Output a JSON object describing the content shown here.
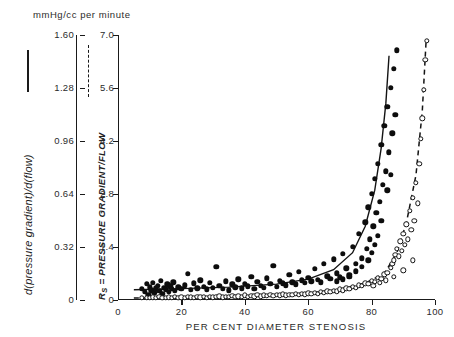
{
  "figure": {
    "units_header": "mmHg/cc per minute",
    "left_axis_caption": "d(pressure gradient)/d(flow)",
    "right_axis_caption_prefix": "R",
    "right_axis_caption_sub": "S",
    "right_axis_caption_rest": " = PRESSURE GRADIENT/FLOW",
    "x_axis_caption": "PER CENT DIAMETER STENOSIS",
    "legend_solid_name": "solid-line-legend-stroke",
    "legend_dashed_name": "dashed-line-legend-stroke"
  },
  "chart_data": {
    "type": "scatter",
    "title": "",
    "xlabel": "PER CENT DIAMETER STENOSIS",
    "ylabel_left": "d(pressure gradient)/d(flow)",
    "ylabel_right": "Rs = PRESSURE GRADIENT/FLOW",
    "units": "mmHg/cc per minute",
    "xlim": [
      0,
      100
    ],
    "xticks": [
      0,
      20,
      40,
      60,
      80,
      100
    ],
    "xticklabels": [
      "0",
      "20",
      "40",
      "60",
      "80",
      "100"
    ],
    "ylim_left": [
      0,
      1.6
    ],
    "yticks_left": [
      0,
      0.32,
      0.64,
      0.96,
      1.28,
      1.6
    ],
    "yticklabels_left": [
      "0",
      "0.32",
      "0.64",
      "0.96",
      "1.28",
      "1.60"
    ],
    "ylim_right": [
      0,
      7.0
    ],
    "yticks_right": [
      0,
      1.4,
      2.8,
      4.2,
      5.6,
      7.0
    ],
    "yticklabels_right": [
      "0",
      "1.4",
      "2.8",
      "4.2",
      "5.6",
      "7.0"
    ],
    "grid": false,
    "legend_position": "axis-captions",
    "series": [
      {
        "name": "d(pressure gradient)/d(flow)",
        "marker": "filled-circle",
        "line": "solid",
        "axis": "left",
        "points": [
          [
            7.5,
            0.3
          ],
          [
            8.5,
            0.22
          ],
          [
            9.0,
            0.42
          ],
          [
            9.5,
            0.13
          ],
          [
            10.0,
            0.34
          ],
          [
            10.5,
            0.26
          ],
          [
            11.0,
            0.45
          ],
          [
            11.5,
            0.19
          ],
          [
            12.0,
            0.31
          ],
          [
            12.5,
            0.38
          ],
          [
            13.0,
            0.24
          ],
          [
            13.5,
            0.5
          ],
          [
            14.0,
            0.17
          ],
          [
            14.5,
            0.33
          ],
          [
            15.0,
            0.28
          ],
          [
            15.5,
            0.41
          ],
          [
            16.0,
            0.22
          ],
          [
            16.5,
            0.36
          ],
          [
            17.0,
            0.3
          ],
          [
            17.5,
            0.47
          ],
          [
            18.0,
            0.25
          ],
          [
            19.0,
            0.34
          ],
          [
            20.0,
            0.29
          ],
          [
            21.0,
            0.39
          ],
          [
            22.0,
            0.7
          ],
          [
            23.0,
            0.27
          ],
          [
            24.0,
            0.44
          ],
          [
            25.0,
            0.31
          ],
          [
            26.0,
            0.52
          ],
          [
            27.0,
            0.35
          ],
          [
            28.0,
            0.28
          ],
          [
            29.0,
            0.46
          ],
          [
            30.0,
            0.33
          ],
          [
            31.0,
            0.88
          ],
          [
            32.0,
            0.37
          ],
          [
            33.0,
            0.3
          ],
          [
            34.0,
            0.49
          ],
          [
            35.0,
            0.26
          ],
          [
            36.0,
            0.41
          ],
          [
            37.0,
            0.34
          ],
          [
            38.0,
            0.55
          ],
          [
            39.0,
            0.31
          ],
          [
            40.0,
            0.43
          ],
          [
            41.0,
            0.36
          ],
          [
            42.0,
            0.62
          ],
          [
            43.0,
            0.29
          ],
          [
            44.0,
            0.48
          ],
          [
            45.0,
            0.38
          ],
          [
            46.0,
            0.33
          ],
          [
            47.0,
            0.57
          ],
          [
            48.0,
            0.42
          ],
          [
            49.0,
            0.9
          ],
          [
            50.0,
            0.35
          ],
          [
            51.0,
            0.51
          ],
          [
            52.0,
            0.44
          ],
          [
            53.0,
            0.39
          ],
          [
            54.0,
            0.66
          ],
          [
            55.0,
            0.47
          ],
          [
            56.0,
            0.41
          ],
          [
            57.0,
            0.74
          ],
          [
            58.0,
            0.52
          ],
          [
            59.0,
            0.45
          ],
          [
            60.0,
            0.58
          ],
          [
            61.0,
            0.49
          ],
          [
            62.0,
            0.82
          ],
          [
            63.0,
            0.54
          ],
          [
            64.0,
            0.47
          ],
          [
            65.0,
            0.95
          ],
          [
            66.0,
            0.63
          ],
          [
            67.0,
            0.56
          ],
          [
            68.0,
            1.08
          ],
          [
            69.0,
            0.71
          ],
          [
            70.0,
            0.6
          ],
          [
            71.0,
            1.22
          ],
          [
            72.0,
            0.84
          ],
          [
            73.0,
            0.67
          ],
          [
            74.0,
            1.4
          ],
          [
            75.0,
            0.96
          ],
          [
            76.0,
            1.75
          ],
          [
            77.0,
            1.1
          ],
          [
            78.0,
            2.05
          ],
          [
            78.5,
            1.35
          ],
          [
            79.0,
            2.45
          ],
          [
            79.5,
            1.6
          ],
          [
            80.0,
            2.8
          ],
          [
            80.5,
            1.95
          ],
          [
            81.0,
            3.2
          ],
          [
            81.5,
            2.3
          ],
          [
            82.0,
            3.6
          ],
          [
            82.5,
            2.6
          ],
          [
            83.0,
            4.1
          ],
          [
            83.5,
            3.05
          ],
          [
            84.0,
            4.6
          ],
          [
            84.5,
            3.4
          ],
          [
            85.0,
            5.1
          ],
          [
            85.5,
            3.9
          ],
          [
            86.0,
            5.6
          ],
          [
            86.5,
            4.4
          ],
          [
            87.0,
            6.1
          ],
          [
            87.5,
            4.9
          ],
          [
            88.0,
            6.6
          ],
          [
            85.0,
            2.9
          ],
          [
            86.0,
            3.3
          ],
          [
            83.0,
            2.1
          ],
          [
            82.0,
            1.7
          ],
          [
            81.0,
            1.45
          ],
          [
            80.0,
            1.25
          ],
          [
            79.0,
            1.05
          ],
          [
            77.0,
            0.88
          ],
          [
            75.0,
            0.76
          ],
          [
            73.0,
            0.62
          ],
          [
            71.0,
            0.55
          ],
          [
            69.0,
            0.49
          ]
        ],
        "fit_line": [
          [
            5,
            0.27
          ],
          [
            20,
            0.3
          ],
          [
            35,
            0.34
          ],
          [
            50,
            0.42
          ],
          [
            60,
            0.55
          ],
          [
            68,
            0.8
          ],
          [
            74,
            1.25
          ],
          [
            78,
            1.95
          ],
          [
            81,
            2.9
          ],
          [
            83,
            4.0
          ],
          [
            84.5,
            5.2
          ],
          [
            85.5,
            6.45
          ]
        ]
      },
      {
        "name": "Rs = PRESSURE GRADIENT/FLOW",
        "marker": "open-circle",
        "line": "dashed",
        "axis": "right",
        "points": [
          [
            7.5,
            0.05
          ],
          [
            9.0,
            0.06
          ],
          [
            10.0,
            0.05
          ],
          [
            11.0,
            0.07
          ],
          [
            12.0,
            0.05
          ],
          [
            13.0,
            0.08
          ],
          [
            14.0,
            0.06
          ],
          [
            15.0,
            0.05
          ],
          [
            16.0,
            0.07
          ],
          [
            17.0,
            0.06
          ],
          [
            18.0,
            0.08
          ],
          [
            19.0,
            0.06
          ],
          [
            20.0,
            0.07
          ],
          [
            21.0,
            0.06
          ],
          [
            22.0,
            0.08
          ],
          [
            23.0,
            0.07
          ],
          [
            24.0,
            0.06
          ],
          [
            25.0,
            0.09
          ],
          [
            26.0,
            0.07
          ],
          [
            27.0,
            0.08
          ],
          [
            28.0,
            0.06
          ],
          [
            29.0,
            0.09
          ],
          [
            30.0,
            0.07
          ],
          [
            31.0,
            0.08
          ],
          [
            32.0,
            0.1
          ],
          [
            33.0,
            0.07
          ],
          [
            34.0,
            0.09
          ],
          [
            35.0,
            0.08
          ],
          [
            36.0,
            0.11
          ],
          [
            37.0,
            0.08
          ],
          [
            38.0,
            0.1
          ],
          [
            39.0,
            0.09
          ],
          [
            40.0,
            0.12
          ],
          [
            41.0,
            0.09
          ],
          [
            42.0,
            0.11
          ],
          [
            43.0,
            0.1
          ],
          [
            44.0,
            0.13
          ],
          [
            45.0,
            0.1
          ],
          [
            46.0,
            0.12
          ],
          [
            47.0,
            0.11
          ],
          [
            48.0,
            0.14
          ],
          [
            49.0,
            0.11
          ],
          [
            50.0,
            0.13
          ],
          [
            51.0,
            0.12
          ],
          [
            52.0,
            0.15
          ],
          [
            53.0,
            0.12
          ],
          [
            54.0,
            0.14
          ],
          [
            55.0,
            0.13
          ],
          [
            56.0,
            0.16
          ],
          [
            57.0,
            0.14
          ],
          [
            58.0,
            0.17
          ],
          [
            59.0,
            0.15
          ],
          [
            60.0,
            0.18
          ],
          [
            61.0,
            0.16
          ],
          [
            62.0,
            0.19
          ],
          [
            63.0,
            0.17
          ],
          [
            64.0,
            0.21
          ],
          [
            65.0,
            0.19
          ],
          [
            66.0,
            0.23
          ],
          [
            67.0,
            0.21
          ],
          [
            68.0,
            0.25
          ],
          [
            69.0,
            0.23
          ],
          [
            70.0,
            0.28
          ],
          [
            71.0,
            0.26
          ],
          [
            72.0,
            0.31
          ],
          [
            73.0,
            0.29
          ],
          [
            74.0,
            0.35
          ],
          [
            75.0,
            0.33
          ],
          [
            76.0,
            0.39
          ],
          [
            77.0,
            0.37
          ],
          [
            78.0,
            0.44
          ],
          [
            79.0,
            0.42
          ],
          [
            80.0,
            0.5
          ],
          [
            81.0,
            0.48
          ],
          [
            82.0,
            0.58
          ],
          [
            83.0,
            0.56
          ],
          [
            84.0,
            0.68
          ],
          [
            85.0,
            0.72
          ],
          [
            86.0,
            0.85
          ],
          [
            86.5,
            0.95
          ],
          [
            87.0,
            1.05
          ],
          [
            87.5,
            1.2
          ],
          [
            88.0,
            1.35
          ],
          [
            88.5,
            1.15
          ],
          [
            89.0,
            1.55
          ],
          [
            89.5,
            1.3
          ],
          [
            90.0,
            1.75
          ],
          [
            90.5,
            1.45
          ],
          [
            91.0,
            2.0
          ],
          [
            91.5,
            1.6
          ],
          [
            92.0,
            2.35
          ],
          [
            92.5,
            1.85
          ],
          [
            93.0,
            2.7
          ],
          [
            93.5,
            2.1
          ],
          [
            94.0,
            3.1
          ],
          [
            94.5,
            2.55
          ],
          [
            95.0,
            3.6
          ],
          [
            95.5,
            4.25
          ],
          [
            96.0,
            4.8
          ],
          [
            96.5,
            5.55
          ],
          [
            97.0,
            6.35
          ],
          [
            97.5,
            6.85
          ],
          [
            93.0,
            1.05
          ],
          [
            90.0,
            0.78
          ],
          [
            87.0,
            0.62
          ],
          [
            84.5,
            0.52
          ],
          [
            82.5,
            0.45
          ],
          [
            80.5,
            0.38
          ]
        ],
        "fit_line": [
          [
            5,
            0.05
          ],
          [
            25,
            0.07
          ],
          [
            45,
            0.11
          ],
          [
            60,
            0.18
          ],
          [
            70,
            0.28
          ],
          [
            78,
            0.45
          ],
          [
            84,
            0.7
          ],
          [
            88,
            1.25
          ],
          [
            91,
            2.05
          ],
          [
            94,
            3.3
          ],
          [
            96,
            5.0
          ],
          [
            97.2,
            6.85
          ]
        ]
      }
    ]
  }
}
